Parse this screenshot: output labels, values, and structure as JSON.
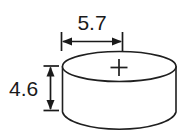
{
  "drawing": {
    "title": "Coin cell battery dimension drawing",
    "subject": "coin-cell-battery",
    "units_note": "",
    "background_color": "#ffffff",
    "line_color": "#1f1f1f",
    "text_color": "#1a1a1a"
  },
  "dimensions": {
    "diameter": {
      "label": "5.7",
      "orientation": "horizontal",
      "measures": "diameter"
    },
    "height": {
      "label": "4.6",
      "orientation": "vertical",
      "measures": "height"
    }
  },
  "markings": {
    "polarity": "+"
  }
}
